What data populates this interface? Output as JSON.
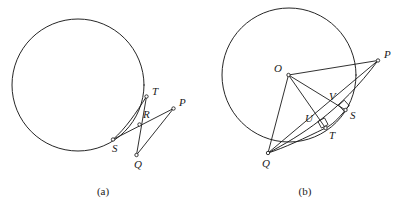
{
  "figure": {
    "background_color": "#ffffff",
    "ink_color": "#1a1a1a",
    "width": 401,
    "height": 207
  },
  "panels": [
    {
      "id": "a",
      "caption": "(a)",
      "caption_pos": {
        "x": 103,
        "y": 195
      },
      "circle": {
        "cx": 78,
        "cy": 85,
        "r": 66
      },
      "points": [
        {
          "name": "T",
          "x": 146.5,
          "y": 96.5,
          "label": "T",
          "lx": 152,
          "ly": 95
        },
        {
          "name": "R",
          "x": 139.5,
          "y": 124.5,
          "label": "R",
          "lx": 143,
          "ly": 118
        },
        {
          "name": "S",
          "x": 113.0,
          "y": 139.5,
          "label": "S",
          "lx": 112,
          "ly": 152
        },
        {
          "name": "Q",
          "x": 136.5,
          "y": 155.0,
          "label": "Q",
          "lx": 134,
          "ly": 168
        },
        {
          "name": "P",
          "x": 173.5,
          "y": 108.5,
          "label": "P",
          "lx": 179,
          "ly": 106
        }
      ],
      "segments": [
        {
          "name": "segment-T-Q",
          "from": "T",
          "to": "Q"
        },
        {
          "name": "segment-S-P",
          "from": "S",
          "to": "P"
        },
        {
          "name": "segment-Q-P",
          "from": "Q",
          "to": "P"
        }
      ],
      "arcs": [
        {
          "name": "arc-chord-T-S",
          "d": "M 146.5 96.5 C 136 113 126 128 113 139.5"
        }
      ]
    },
    {
      "id": "b",
      "caption": "(b)",
      "caption_pos": {
        "x": 305,
        "y": 195
      },
      "circle": {
        "cx": 289,
        "cy": 75,
        "r": 67
      },
      "points": [
        {
          "name": "O",
          "x": 288.5,
          "y": 75.0,
          "label": "O",
          "lx": 274,
          "ly": 72
        },
        {
          "name": "P",
          "x": 378.0,
          "y": 60.5,
          "label": "P",
          "lx": 384,
          "ly": 58
        },
        {
          "name": "Q",
          "x": 268.0,
          "y": 153.0,
          "label": "Q",
          "lx": 262,
          "ly": 167
        },
        {
          "name": "S",
          "x": 345.5,
          "y": 110.0,
          "label": "S",
          "lx": 350,
          "ly": 119
        },
        {
          "name": "T",
          "x": 325.5,
          "y": 128.0,
          "label": "T",
          "lx": 329,
          "ly": 139
        },
        {
          "name": "V",
          "x": 337.0,
          "y": 104.0,
          "label": "V",
          "lx": 329,
          "ly": 100
        },
        {
          "name": "U",
          "x": 316.0,
          "y": 122.5,
          "label": "U",
          "lx": 305,
          "ly": 122
        }
      ],
      "segments": [
        {
          "name": "segment-Q-P-upper",
          "from": "Q",
          "to": "P"
        },
        {
          "name": "segment-O-S",
          "from": "O",
          "to": "S"
        },
        {
          "name": "segment-O-T",
          "from": "O",
          "to": "T"
        },
        {
          "name": "segment-O-Q",
          "from": "O",
          "to": "Q"
        },
        {
          "name": "segment-O-P",
          "from": "O",
          "to": "P"
        }
      ],
      "arcs": [
        {
          "name": "arc-chord-S-T-Q",
          "d": "M 345.5 110.0 C 338 119 332 125 325.5 128.0 C 305 138 284 148 268 153"
        },
        {
          "name": "arc-tangent-Q-to-P",
          "d": "M 268 153 C 300 136 340 112 378 60.5"
        }
      ],
      "right_angles": [
        {
          "name": "right-angle-at-S",
          "cx": 344.0,
          "cy": 105.5,
          "size": 7.5,
          "rotation": -42
        },
        {
          "name": "right-angle-at-T",
          "cx": 323.0,
          "cy": 123.0,
          "size": 7.5,
          "rotation": -28
        }
      ]
    }
  ]
}
